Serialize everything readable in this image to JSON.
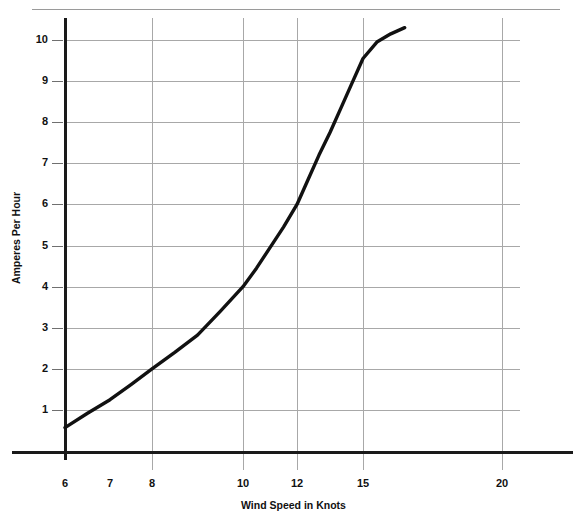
{
  "chart_data": {
    "type": "line",
    "title": "",
    "xlabel": "Wind Speed in Knots",
    "ylabel": "Amperes Per Hour",
    "xlim": [
      6,
      21.8
    ],
    "ylim": [
      0,
      10.6
    ],
    "grid": true,
    "legend": false,
    "x_ticks": [
      6,
      7,
      8,
      10,
      12,
      15,
      20
    ],
    "x_tick_labels": [
      "6",
      "7",
      "8",
      "10",
      "12",
      "15",
      "20"
    ],
    "x_ticks_with_gridline": [
      6,
      8,
      10,
      12,
      15,
      20
    ],
    "y_ticks": [
      1,
      2,
      3,
      4,
      5,
      6,
      7,
      8,
      9,
      10
    ],
    "y_tick_labels": [
      "1",
      "2",
      "3",
      "4",
      "5",
      "6",
      "7",
      "8",
      "9",
      "10"
    ],
    "series": [
      {
        "name": "Output",
        "color": "#111111",
        "x": [
          6.0,
          6.5,
          7.0,
          7.5,
          8.0,
          8.5,
          9.0,
          9.5,
          10.0,
          10.5,
          11.0,
          11.5,
          12.0,
          12.5,
          13.0,
          13.5,
          14.0,
          14.5,
          15.0,
          15.5,
          16.0,
          16.5
        ],
        "y": [
          0.57,
          0.92,
          1.25,
          1.62,
          2.0,
          2.4,
          2.82,
          3.4,
          4.0,
          4.45,
          4.95,
          5.45,
          6.0,
          6.6,
          7.2,
          7.75,
          8.35,
          8.95,
          9.55,
          9.95,
          10.15,
          10.3
        ]
      }
    ],
    "annotations": []
  },
  "axes": {
    "x_axis_title": "Wind Speed in Knots",
    "y_axis_title": "Amperes Per Hour"
  },
  "ticks": {
    "y": [
      {
        "label": "10",
        "value": 10
      },
      {
        "label": "9",
        "value": 9
      },
      {
        "label": "8",
        "value": 8
      },
      {
        "label": "7",
        "value": 7
      },
      {
        "label": "6",
        "value": 6
      },
      {
        "label": "5",
        "value": 5
      },
      {
        "label": "4",
        "value": 4
      },
      {
        "label": "3",
        "value": 3
      },
      {
        "label": "2",
        "value": 2
      },
      {
        "label": "1",
        "value": 1
      }
    ],
    "x": [
      {
        "label": "6",
        "value": 6
      },
      {
        "label": "7",
        "value": 7
      },
      {
        "label": "8",
        "value": 8
      },
      {
        "label": "10",
        "value": 10
      },
      {
        "label": "12",
        "value": 12
      },
      {
        "label": "15",
        "value": 15
      },
      {
        "label": "20",
        "value": 20
      }
    ]
  }
}
